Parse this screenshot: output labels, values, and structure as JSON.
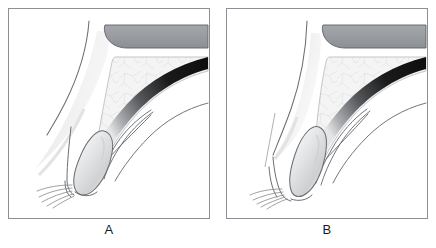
{
  "figure": {
    "background_color": "#ffffff",
    "frame_color": "#8c9094",
    "panel_count": 2
  },
  "panels": [
    {
      "id": "panel-a",
      "label": "A",
      "description": "Sagittal line drawing showing open configuration with diagonal soft tissue band extending to lower left and obliquely tilted oval structure"
    },
    {
      "id": "panel-b",
      "label": "B",
      "description": "Sagittal line drawing showing closed configuration with single sweeping left contour and upright oval structure"
    }
  ],
  "colors": {
    "dark_band": "#9a9da1",
    "dark_band_stroke": "#5f6265",
    "reticular_fill": "#f2f2f2",
    "reticular_stroke": "#b9bcc0",
    "black_band": "#121212",
    "soft_tissue": "#efefef",
    "line": "#6b6e72",
    "oval_fill": "#e8e8e8",
    "label_text": "#1a1a1a",
    "frame": "#8c9094",
    "background": "#ffffff"
  },
  "structures": {
    "dark_band": "dark-gray-band",
    "reticular_wedge": "reticular-textured-wedge",
    "black_striated_band": "black-striated-band",
    "oval_body": "oval-structure",
    "radiating_fibers": "radiating-fibers",
    "canal_lines": "canal-wall-lines",
    "soft_tissue_band": "soft-tissue-band"
  }
}
